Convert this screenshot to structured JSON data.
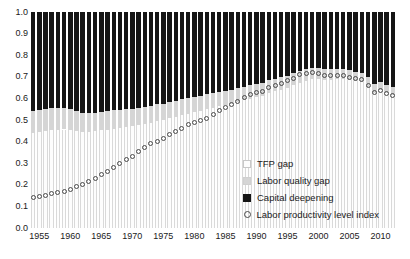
{
  "chart_data": {
    "type": "bar",
    "title": "",
    "subtitle": "",
    "xlabel": "",
    "ylabel": "",
    "stacked": true,
    "grid": false,
    "ylim": [
      0.0,
      1.0
    ],
    "ytick_labels": [
      "1.0",
      "0.9",
      "0.8",
      "0.7",
      "0.6",
      "0.5",
      "0.4",
      "0.3",
      "0.2",
      "0.1",
      "0.0"
    ],
    "ytick_values": [
      1.0,
      0.9,
      0.8,
      0.7,
      0.6,
      0.5,
      0.4,
      0.3,
      0.2,
      0.1,
      0.0
    ],
    "xtick_labels": [
      "1955",
      "1960",
      "1965",
      "1970",
      "1975",
      "1980",
      "1985",
      "1990",
      "1995",
      "2000",
      "2005",
      "2010"
    ],
    "xtick_values": [
      1955,
      1960,
      1965,
      1970,
      1975,
      1980,
      1985,
      1990,
      1995,
      2000,
      2005,
      2010
    ],
    "xlim": [
      1953.5,
      2012.5
    ],
    "legend_position": "inside-bottom-right",
    "categories": [
      1954,
      1955,
      1956,
      1957,
      1958,
      1959,
      1960,
      1961,
      1962,
      1963,
      1964,
      1965,
      1966,
      1967,
      1968,
      1969,
      1970,
      1971,
      1972,
      1973,
      1974,
      1975,
      1976,
      1977,
      1978,
      1979,
      1980,
      1981,
      1982,
      1983,
      1984,
      1985,
      1986,
      1987,
      1988,
      1989,
      1990,
      1991,
      1992,
      1993,
      1994,
      1995,
      1996,
      1997,
      1998,
      1999,
      2000,
      2001,
      2002,
      2003,
      2004,
      2005,
      2006,
      2007,
      2008,
      2009,
      2010,
      2011,
      2012
    ],
    "series": [
      {
        "name": "Labor productivity level index",
        "type": "scatter",
        "marker": "open-circle",
        "color": "#4a4a4a",
        "values": [
          0.142,
          0.148,
          0.152,
          0.158,
          0.163,
          0.17,
          0.18,
          0.191,
          0.203,
          0.216,
          0.231,
          0.246,
          0.263,
          0.278,
          0.297,
          0.315,
          0.333,
          0.352,
          0.372,
          0.391,
          0.4,
          0.414,
          0.432,
          0.447,
          0.462,
          0.478,
          0.487,
          0.5,
          0.509,
          0.527,
          0.545,
          0.558,
          0.573,
          0.587,
          0.603,
          0.616,
          0.627,
          0.633,
          0.652,
          0.66,
          0.671,
          0.681,
          0.694,
          0.709,
          0.714,
          0.719,
          0.716,
          0.704,
          0.705,
          0.706,
          0.706,
          0.699,
          0.692,
          0.686,
          0.662,
          0.629,
          0.637,
          0.621,
          0.613
        ]
      },
      {
        "name": "TFP gap",
        "type": "stack-segment",
        "color": "#fdfdfd",
        "values": [
          0.438,
          0.444,
          0.448,
          0.452,
          0.454,
          0.456,
          0.452,
          0.449,
          0.444,
          0.443,
          0.447,
          0.452,
          0.456,
          0.46,
          0.465,
          0.468,
          0.471,
          0.476,
          0.481,
          0.488,
          0.495,
          0.5,
          0.509,
          0.516,
          0.523,
          0.53,
          0.537,
          0.543,
          0.55,
          0.557,
          0.563,
          0.568,
          0.576,
          0.583,
          0.591,
          0.598,
          0.606,
          0.612,
          0.624,
          0.632,
          0.641,
          0.65,
          0.661,
          0.673,
          0.681,
          0.688,
          0.69,
          0.684,
          0.686,
          0.688,
          0.689,
          0.684,
          0.679,
          0.674,
          0.654,
          0.626,
          0.637,
          0.623,
          0.616
        ]
      },
      {
        "name": "Labor quality gap",
        "type": "stack-segment",
        "color": "#d5d5d5",
        "values": [
          0.102,
          0.104,
          0.105,
          0.104,
          0.103,
          0.1,
          0.097,
          0.093,
          0.09,
          0.088,
          0.087,
          0.086,
          0.085,
          0.084,
          0.083,
          0.082,
          0.081,
          0.08,
          0.079,
          0.078,
          0.077,
          0.076,
          0.075,
          0.074,
          0.073,
          0.072,
          0.071,
          0.07,
          0.069,
          0.068,
          0.067,
          0.066,
          0.065,
          0.064,
          0.063,
          0.062,
          0.061,
          0.06,
          0.059,
          0.058,
          0.057,
          0.056,
          0.055,
          0.054,
          0.053,
          0.052,
          0.051,
          0.05,
          0.049,
          0.048,
          0.047,
          0.046,
          0.045,
          0.044,
          0.043,
          0.042,
          0.041,
          0.04,
          0.039
        ]
      },
      {
        "name": "Capital deepening",
        "type": "stack-segment",
        "color": "#151515",
        "values": [
          0.46,
          0.452,
          0.447,
          0.444,
          0.443,
          0.444,
          0.451,
          0.458,
          0.466,
          0.469,
          0.466,
          0.462,
          0.459,
          0.456,
          0.452,
          0.45,
          0.448,
          0.444,
          0.44,
          0.434,
          0.428,
          0.424,
          0.416,
          0.41,
          0.404,
          0.398,
          0.392,
          0.387,
          0.381,
          0.375,
          0.37,
          0.366,
          0.359,
          0.353,
          0.346,
          0.34,
          0.333,
          0.328,
          0.317,
          0.31,
          0.302,
          0.294,
          0.284,
          0.273,
          0.266,
          0.26,
          0.259,
          0.266,
          0.265,
          0.264,
          0.264,
          0.27,
          0.276,
          0.282,
          0.303,
          0.332,
          0.322,
          0.337,
          0.345
        ]
      }
    ]
  },
  "legend": {
    "items": [
      {
        "label": "TFP gap",
        "swatch": "tfp-swatch"
      },
      {
        "label": "Labor quality gap",
        "swatch": "labor-quality-swatch"
      },
      {
        "label": "Capital deepening",
        "swatch": "capital-deepening-swatch"
      },
      {
        "label": "Labor productivity level index",
        "swatch": "labor-productivity-marker"
      }
    ]
  },
  "colors": {
    "tfp_gap": "#fdfdfd",
    "labor_quality_gap": "#d5d5d5",
    "capital_deepening": "#151515",
    "marker": "#4a4a4a",
    "text": "#1a1a1a",
    "background": "#ffffff"
  }
}
